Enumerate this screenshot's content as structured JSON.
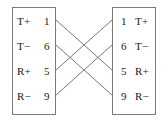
{
  "diagram": {
    "type": "crossover-cable-pinout",
    "canvas": {
      "width": 168,
      "height": 124
    },
    "line_color": "#7a7a7a",
    "text_color": "#1a1a1a",
    "left_connector": {
      "name": "left-connector",
      "pins": [
        {
          "signal": "T+",
          "number": "1"
        },
        {
          "signal": "T−",
          "number": "6"
        },
        {
          "signal": "R+",
          "number": "5"
        },
        {
          "signal": "R−",
          "number": "9"
        }
      ]
    },
    "right_connector": {
      "name": "right-connector",
      "pins": [
        {
          "signal": "T+",
          "number": "1"
        },
        {
          "signal": "T−",
          "number": "6"
        },
        {
          "signal": "R+",
          "number": "5"
        },
        {
          "signal": "R−",
          "number": "9"
        }
      ]
    },
    "connections": [
      {
        "from_pin": "1",
        "to_pin": "5",
        "from_y": 20,
        "to_y": 70
      },
      {
        "from_pin": "6",
        "to_pin": "9",
        "from_y": 45,
        "to_y": 95
      },
      {
        "from_pin": "5",
        "to_pin": "1",
        "from_y": 70,
        "to_y": 20
      },
      {
        "from_pin": "9",
        "to_pin": "6",
        "from_y": 95,
        "to_y": 45
      }
    ]
  }
}
